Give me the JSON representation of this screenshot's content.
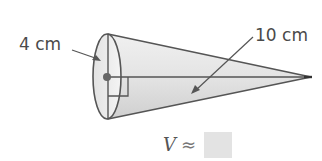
{
  "figure": {
    "shape": "cone",
    "radius_label": "4 cm",
    "slant_height_label": "10 cm",
    "volume_variable": "V",
    "approx_symbol": "≈",
    "answer_value": ""
  },
  "colors": {
    "stroke": "#555555",
    "fill_light": "#efefef",
    "fill_dark": "#d2d2d2",
    "text": "#4a4a4a",
    "answer_box": "#e3e3e3"
  }
}
